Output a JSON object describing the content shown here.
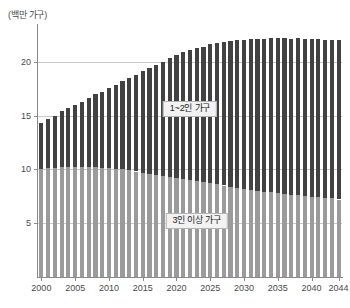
{
  "chart_data": {
    "type": "bar",
    "stacked": true,
    "title": "",
    "subtitle": "",
    "xlabel": "",
    "ylabel": "(백만 가구)",
    "unit_caption": "(백만 가구)",
    "ylim": [
      0,
      23.5
    ],
    "y_ticks": [
      5,
      10,
      15,
      20
    ],
    "grid": true,
    "legend_position": "in-plot",
    "x": [
      2000,
      2001,
      2002,
      2003,
      2004,
      2005,
      2006,
      2007,
      2008,
      2009,
      2010,
      2011,
      2012,
      2013,
      2014,
      2015,
      2016,
      2017,
      2018,
      2019,
      2020,
      2021,
      2022,
      2023,
      2024,
      2025,
      2026,
      2027,
      2028,
      2029,
      2030,
      2031,
      2032,
      2033,
      2034,
      2035,
      2036,
      2037,
      2038,
      2039,
      2040,
      2041,
      2042,
      2043,
      2044
    ],
    "x_tick_labels": [
      "2000",
      "2005",
      "2010",
      "2015",
      "2020",
      "2025",
      "2030",
      "2035",
      "2040",
      "2044"
    ],
    "x_tick_values": [
      2000,
      2005,
      2010,
      2015,
      2020,
      2025,
      2030,
      2035,
      2040,
      2044
    ],
    "series": [
      {
        "name": "3인 이상 가구",
        "color": "#9b9b9b",
        "label_text": "3인 이상 가구",
        "label_x": 2023,
        "label_y": 5.2,
        "values": [
          10.0,
          10.1,
          10.1,
          10.2,
          10.2,
          10.2,
          10.2,
          10.2,
          10.2,
          10.1,
          10.1,
          10.0,
          10.0,
          9.9,
          9.8,
          9.7,
          9.6,
          9.5,
          9.4,
          9.3,
          9.2,
          9.1,
          9.0,
          8.9,
          8.8,
          8.7,
          8.6,
          8.5,
          8.4,
          8.3,
          8.2,
          8.1,
          8.0,
          7.9,
          7.9,
          7.8,
          7.7,
          7.6,
          7.6,
          7.5,
          7.4,
          7.4,
          7.3,
          7.3,
          7.2
        ]
      },
      {
        "name": "1~2인 가구",
        "color": "#424242",
        "label_text": "1~2인 가구",
        "label_x": 2022,
        "label_y": 15.6,
        "values": [
          4.3,
          4.6,
          4.9,
          5.2,
          5.5,
          5.8,
          6.1,
          6.4,
          6.8,
          7.1,
          7.5,
          7.8,
          8.2,
          8.6,
          9.0,
          9.4,
          9.8,
          10.2,
          10.6,
          11.0,
          11.4,
          11.8,
          12.1,
          12.4,
          12.6,
          12.9,
          13.1,
          13.3,
          13.5,
          13.7,
          13.8,
          14.0,
          14.1,
          14.2,
          14.3,
          14.4,
          14.5,
          14.5,
          14.6,
          14.6,
          14.7,
          14.7,
          14.7,
          14.7,
          14.8
        ]
      }
    ],
    "totals": [
      14.3,
      14.7,
      15.0,
      15.4,
      15.7,
      16.0,
      16.3,
      16.6,
      17.0,
      17.2,
      17.6,
      17.8,
      18.2,
      18.5,
      18.8,
      19.1,
      19.4,
      19.7,
      20.0,
      20.3,
      20.6,
      20.9,
      21.1,
      21.3,
      21.4,
      21.6,
      21.7,
      21.8,
      21.9,
      22.0,
      22.0,
      22.1,
      22.1,
      22.1,
      22.2,
      22.2,
      22.2,
      22.1,
      22.2,
      22.1,
      22.1,
      22.1,
      22.0,
      22.0,
      22.0
    ]
  }
}
